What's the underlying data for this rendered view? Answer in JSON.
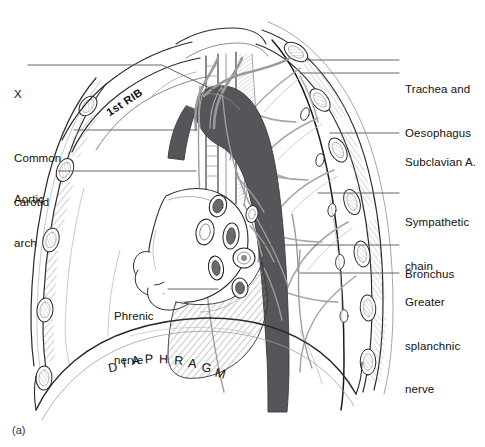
{
  "figure": {
    "caption": "(a)",
    "diaphragm_label": "DIAPHRAGM",
    "rib_label": "1st RIB",
    "colors": {
      "background": "#ffffff",
      "ink": "#111111",
      "leader_line": "#555555",
      "aorta_fill": "#55555a",
      "bone_outline": "#333333",
      "hatch": "#8a8a8a",
      "vessel_gray": "#9a9a9a",
      "muscle_gray": "#c9c9c9"
    }
  },
  "labels_left": [
    {
      "id": "x-marker",
      "text": "X",
      "lines": [
        "X"
      ],
      "x": 14,
      "y": 58,
      "leader": {
        "from_x": 28,
        "from_y": 65,
        "to_x": 195,
        "to_y": 65,
        "elbow_x": 160,
        "elbow_y": 65,
        "end_x": 228,
        "end_y": 96
      }
    },
    {
      "id": "common-carotid",
      "text": "Common carotid",
      "lines": [
        "Common",
        "carotid"
      ],
      "x": 14,
      "y": 122,
      "leader": {
        "from_x": 74,
        "from_y": 130,
        "to_x": 196,
        "to_y": 130
      }
    },
    {
      "id": "aortic-arch",
      "text": "Aortic arch",
      "lines": [
        "Aortic",
        "arch"
      ],
      "x": 14,
      "y": 163,
      "leader": {
        "from_x": 58,
        "from_y": 171,
        "to_x": 196,
        "to_y": 171
      }
    },
    {
      "id": "phrenic-nerve",
      "text": "Phrenic nerve",
      "lines": [
        "Phrenic",
        "nerve"
      ],
      "x": 114,
      "y": 280,
      "leader": {
        "from_x": 168,
        "from_y": 289,
        "to_x": 218,
        "to_y": 289
      }
    }
  ],
  "labels_right": [
    {
      "id": "trachea-and-oesophagus",
      "text": "Trachea and Oesophagus",
      "lines": [
        "Trachea and",
        "Oesophagus"
      ],
      "x": 405,
      "y": 53,
      "leaders": [
        {
          "from_x": 399,
          "from_y": 60,
          "to_x": 307,
          "to_y": 60
        },
        {
          "from_x": 399,
          "from_y": 73,
          "to_x": 300,
          "to_y": 73
        }
      ]
    },
    {
      "id": "subclavian-artery",
      "text": "Subclavian A.",
      "lines": [
        "Subclavian A."
      ],
      "x": 405,
      "y": 126,
      "leaders": [
        {
          "from_x": 399,
          "from_y": 133,
          "to_x": 330,
          "to_y": 133
        }
      ]
    },
    {
      "id": "sympathetic-chain",
      "text": "Sympathetic chain",
      "lines": [
        "Sympathetic",
        "chain"
      ],
      "x": 405,
      "y": 186,
      "leaders": [
        {
          "from_x": 399,
          "from_y": 193,
          "to_x": 318,
          "to_y": 193
        }
      ]
    },
    {
      "id": "bronchus",
      "text": "Bronchus",
      "lines": [
        "Bronchus"
      ],
      "x": 405,
      "y": 238,
      "leaders": [
        {
          "from_x": 399,
          "from_y": 245,
          "to_x": 262,
          "to_y": 245
        }
      ]
    },
    {
      "id": "greater-splanchnic-nerve",
      "text": "Greater splanchnic nerve",
      "lines": [
        "Greater",
        "splanchnic",
        "nerve"
      ],
      "x": 405,
      "y": 266,
      "leaders": [
        {
          "from_x": 399,
          "from_y": 273,
          "to_x": 300,
          "to_y": 273
        }
      ]
    }
  ]
}
